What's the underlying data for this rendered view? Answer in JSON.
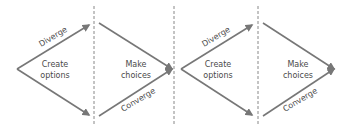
{
  "diagram": {
    "type": "double-diamond",
    "colors": {
      "arrow": "#777777",
      "divider": "#888888",
      "text": "#4a4a4a",
      "background": "#ffffff"
    },
    "dividers": [
      94,
      174,
      258
    ],
    "diamonds": [
      {
        "diverge_label": "Diverge",
        "converge_label": "Converge",
        "left_text_line1": "Create",
        "left_text_line2": "options",
        "right_text_line1": "Make",
        "right_text_line2": "choices"
      },
      {
        "diverge_label": "Diverge",
        "converge_label": "Converge",
        "left_text_line1": "Create",
        "left_text_line2": "options",
        "right_text_line1": "Make",
        "right_text_line2": "choices"
      }
    ]
  }
}
